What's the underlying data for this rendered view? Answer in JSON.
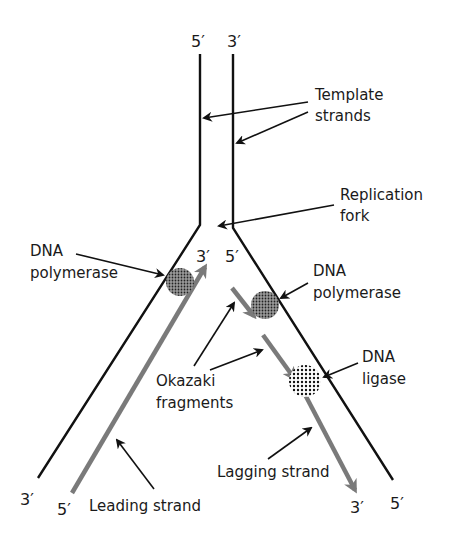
{
  "diagram": {
    "type": "dna-replication-fork",
    "colors": {
      "template_strand": "#111111",
      "new_strand": "#7a7a7a",
      "pointer": "#111111",
      "enzyme": "#555555",
      "background": "#ffffff"
    },
    "end_labels": {
      "top_left": "5′",
      "top_right": "3′",
      "fork_left": "3′",
      "fork_right": "5′",
      "bottom_left_template": "3′",
      "bottom_left_leading": "5′",
      "bottom_right_lagging": "3′",
      "bottom_right_template": "5′"
    },
    "labels": {
      "template_strands": [
        "Template",
        "strands"
      ],
      "replication_fork": [
        "Replication",
        "fork"
      ],
      "dna_polymerase_left": [
        "DNA",
        "polymerase"
      ],
      "dna_polymerase_right": [
        "DNA",
        "polymerase"
      ],
      "dna_ligase": [
        "DNA",
        "ligase"
      ],
      "okazaki_fragments": [
        "Okazaki",
        "fragments"
      ],
      "leading_strand": "Leading strand",
      "lagging_strand": "Lagging strand"
    }
  }
}
